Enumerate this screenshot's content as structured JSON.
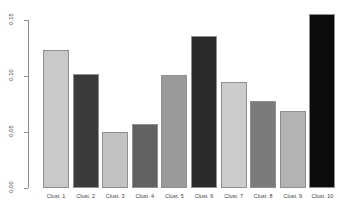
{
  "chart_data": {
    "type": "bar",
    "title": "",
    "subtitle": "",
    "xlabel": "",
    "ylabel": "",
    "grid": false,
    "legend": "none",
    "orientation": "vertical",
    "categories": [
      "Clust. 1",
      "Clust. 2",
      "Clust. 3",
      "Clust. 4",
      "Clust. 5",
      "Clust. 6",
      "Clust. 7",
      "Clust. 8",
      "Clust. 9",
      "Clust. 10"
    ],
    "values": [
      0.123,
      0.102,
      0.05,
      0.057,
      0.101,
      0.136,
      0.095,
      0.078,
      0.069,
      0.155
    ],
    "bar_colors": [
      "#c9c9c9",
      "#3a3a3a",
      "#c2c2c2",
      "#626262",
      "#9a9a9a",
      "#2b2b2b",
      "#cccccc",
      "#7b7b7b",
      "#b3b3b3",
      "#0c0c0c"
    ],
    "ylim": [
      0.0,
      0.155
    ],
    "yticks": [
      0.0,
      0.05,
      0.1,
      0.15
    ],
    "ytick_labels": [
      "0.00",
      "0.05",
      "0.10",
      "0.15"
    ],
    "xtick_labels": [
      "Clust. 1",
      "Clust. 2",
      "Clust. 3",
      "Clust. 4",
      "Clust. 5",
      "Clust. 6",
      "Clust. 7",
      "Clust. 8",
      "Clust. 9",
      "Clust. 10"
    ],
    "axis_color": "#8c8c8c",
    "bar_border_color": "#8f8f8f",
    "background_color": "#ffffff",
    "text_color": "#3b3b3b"
  }
}
